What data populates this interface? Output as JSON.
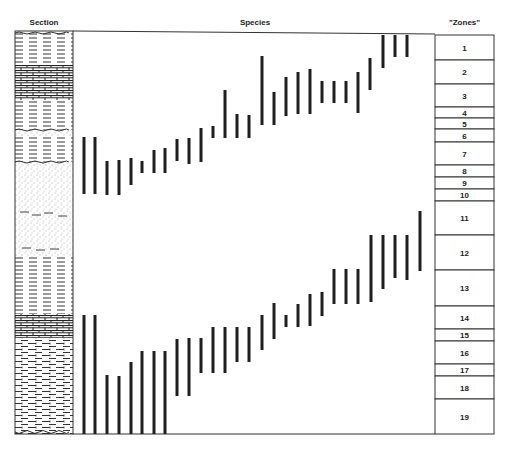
{
  "headers": {
    "section": "Section",
    "species": "Species",
    "zones": "\"Zones\""
  },
  "colors": {
    "ink": "#1f1f1f",
    "frame": "#333333"
  },
  "frame": {
    "section_x": [
      15,
      73
    ],
    "species_x": [
      73,
      435
    ],
    "zones_x": [
      435,
      494
    ],
    "top": 31,
    "bottom": 434
  },
  "zones": [
    {
      "label": "1",
      "top": 35,
      "bottom": 60
    },
    {
      "label": "2",
      "top": 60,
      "bottom": 84
    },
    {
      "label": "3",
      "top": 84,
      "bottom": 107
    },
    {
      "label": "4",
      "top": 107,
      "bottom": 118
    },
    {
      "label": "5",
      "top": 118,
      "bottom": 129
    },
    {
      "label": "6",
      "top": 129,
      "bottom": 142
    },
    {
      "label": "7",
      "top": 142,
      "bottom": 165
    },
    {
      "label": "8",
      "top": 165,
      "bottom": 177
    },
    {
      "label": "9",
      "top": 177,
      "bottom": 189
    },
    {
      "label": "10",
      "top": 189,
      "bottom": 201
    },
    {
      "label": "11",
      "top": 201,
      "bottom": 235
    },
    {
      "label": "12",
      "top": 235,
      "bottom": 270
    },
    {
      "label": "13",
      "top": 270,
      "bottom": 306
    },
    {
      "label": "14",
      "top": 306,
      "bottom": 329
    },
    {
      "label": "15",
      "top": 329,
      "bottom": 341
    },
    {
      "label": "16",
      "top": 341,
      "bottom": 364
    },
    {
      "label": "17",
      "top": 364,
      "bottom": 376
    },
    {
      "label": "18",
      "top": 376,
      "bottom": 399
    },
    {
      "label": "19",
      "top": 399,
      "bottom": 434
    }
  ],
  "section_layers": [
    {
      "type": "shale",
      "top": 31,
      "bottom": 65
    },
    {
      "type": "limestone",
      "top": 65,
      "bottom": 100
    },
    {
      "type": "shale",
      "top": 100,
      "bottom": 130
    },
    {
      "type": "sandy-unconformity",
      "top": 130,
      "bottom": 136
    },
    {
      "type": "shale",
      "top": 136,
      "bottom": 162
    },
    {
      "type": "sandstone",
      "top": 162,
      "bottom": 196
    },
    {
      "type": "silty-sandstone",
      "top": 196,
      "bottom": 257
    },
    {
      "type": "shale",
      "top": 257,
      "bottom": 314
    },
    {
      "type": "limestone",
      "top": 314,
      "bottom": 338
    },
    {
      "type": "shaly-limestone",
      "top": 338,
      "bottom": 434
    }
  ],
  "species_ranges_upper": [
    {
      "x": 84,
      "y1": 137,
      "y2": 194
    },
    {
      "x": 95,
      "y1": 137,
      "y2": 194
    },
    {
      "x": 107,
      "y1": 161,
      "y2": 195
    },
    {
      "x": 119,
      "y1": 160,
      "y2": 195
    },
    {
      "x": 131,
      "y1": 158,
      "y2": 185
    },
    {
      "x": 142,
      "y1": 161,
      "y2": 173
    },
    {
      "x": 154,
      "y1": 150,
      "y2": 173
    },
    {
      "x": 165,
      "y1": 148,
      "y2": 173
    },
    {
      "x": 177,
      "y1": 139,
      "y2": 161
    },
    {
      "x": 189,
      "y1": 138,
      "y2": 164
    },
    {
      "x": 201,
      "y1": 128,
      "y2": 162
    },
    {
      "x": 213,
      "y1": 126,
      "y2": 138
    },
    {
      "x": 225,
      "y1": 90,
      "y2": 138
    },
    {
      "x": 237,
      "y1": 114,
      "y2": 138
    },
    {
      "x": 249,
      "y1": 115,
      "y2": 138
    },
    {
      "x": 262,
      "y1": 56,
      "y2": 125
    },
    {
      "x": 274,
      "y1": 92,
      "y2": 125
    },
    {
      "x": 286,
      "y1": 77,
      "y2": 116
    },
    {
      "x": 298,
      "y1": 72,
      "y2": 114
    },
    {
      "x": 310,
      "y1": 69,
      "y2": 114
    },
    {
      "x": 322,
      "y1": 81,
      "y2": 103
    },
    {
      "x": 334,
      "y1": 81,
      "y2": 103
    },
    {
      "x": 346,
      "y1": 81,
      "y2": 103
    },
    {
      "x": 358,
      "y1": 72,
      "y2": 113
    },
    {
      "x": 370,
      "y1": 58,
      "y2": 90
    },
    {
      "x": 383,
      "y1": 35,
      "y2": 68
    },
    {
      "x": 395,
      "y1": 35,
      "y2": 57
    },
    {
      "x": 407,
      "y1": 35,
      "y2": 57
    }
  ],
  "species_ranges_lower": [
    {
      "x": 84,
      "y1": 315,
      "y2": 434
    },
    {
      "x": 95,
      "y1": 315,
      "y2": 434
    },
    {
      "x": 107,
      "y1": 375,
      "y2": 434
    },
    {
      "x": 119,
      "y1": 376,
      "y2": 434
    },
    {
      "x": 131,
      "y1": 362,
      "y2": 434
    },
    {
      "x": 142,
      "y1": 351,
      "y2": 434
    },
    {
      "x": 154,
      "y1": 351,
      "y2": 434
    },
    {
      "x": 165,
      "y1": 351,
      "y2": 434
    },
    {
      "x": 177,
      "y1": 339,
      "y2": 396
    },
    {
      "x": 189,
      "y1": 338,
      "y2": 396
    },
    {
      "x": 201,
      "y1": 338,
      "y2": 373
    },
    {
      "x": 213,
      "y1": 327,
      "y2": 373
    },
    {
      "x": 225,
      "y1": 327,
      "y2": 373
    },
    {
      "x": 237,
      "y1": 327,
      "y2": 362
    },
    {
      "x": 249,
      "y1": 327,
      "y2": 362
    },
    {
      "x": 262,
      "y1": 315,
      "y2": 350
    },
    {
      "x": 274,
      "y1": 303,
      "y2": 339
    },
    {
      "x": 286,
      "y1": 315,
      "y2": 327
    },
    {
      "x": 298,
      "y1": 304,
      "y2": 327
    },
    {
      "x": 310,
      "y1": 294,
      "y2": 326
    },
    {
      "x": 322,
      "y1": 292,
      "y2": 316
    },
    {
      "x": 334,
      "y1": 269,
      "y2": 304
    },
    {
      "x": 346,
      "y1": 269,
      "y2": 304
    },
    {
      "x": 358,
      "y1": 269,
      "y2": 304
    },
    {
      "x": 371,
      "y1": 235,
      "y2": 302
    },
    {
      "x": 383,
      "y1": 235,
      "y2": 289
    },
    {
      "x": 395,
      "y1": 235,
      "y2": 278
    },
    {
      "x": 407,
      "y1": 235,
      "y2": 280
    },
    {
      "x": 420,
      "y1": 211,
      "y2": 271
    }
  ]
}
